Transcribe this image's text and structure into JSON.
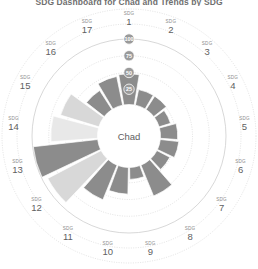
{
  "chart": {
    "title": "SDG Dashboard for Chad and Trends by SDG",
    "center_label": "Chad",
    "sdg_prefix": "SDG",
    "axis_ticks": [
      "100",
      "75",
      "50",
      "25"
    ],
    "tick_values": [
      100,
      75,
      50,
      25
    ]
  },
  "colors": {
    "dark_gray": "#8c8c8c",
    "light_gray": "#d8d8d8",
    "pale_gray": "#e8e8e8",
    "grid": "#c9c9c9",
    "hub_text": "#5e5e5e",
    "label_text": "#5f5f5f",
    "tick_bubble": "#9a9a9a",
    "background": "#ffffff"
  },
  "chart_data": {
    "type": "bar",
    "title": "SDG Dashboard for Chad and Trends by SDG",
    "subtitle": "Chad",
    "xlabel": "",
    "ylabel": "SDG Index score",
    "ylim": [
      0,
      100
    ],
    "grid": true,
    "legend": "none",
    "radial": true,
    "categories": [
      "SDG 1",
      "SDG 2",
      "SDG 3",
      "SDG 4",
      "SDG 5",
      "SDG 6",
      "SDG 7",
      "SDG 8",
      "SDG 9",
      "SDG 10",
      "SDG 11",
      "SDG 12",
      "SDG 13",
      "SDG 14",
      "SDG 15",
      "SDG 16",
      "SDG 17"
    ],
    "tick_labels": [
      "25",
      "50",
      "75",
      "100"
    ],
    "values": [
      48,
      26,
      26,
      20,
      28,
      30,
      24,
      52,
      20,
      42,
      58,
      92,
      99,
      72,
      62,
      36,
      46
    ],
    "shades": [
      "dark",
      "dark",
      "dark",
      "dark",
      "dark",
      "dark",
      "dark",
      "dark",
      "dark",
      "dark",
      "dark",
      "light",
      "dark",
      "pale",
      "light",
      "dark",
      "dark"
    ],
    "series": [
      {
        "name": "SDG Index score",
        "values": [
          48,
          26,
          26,
          20,
          28,
          30,
          24,
          52,
          20,
          42,
          58,
          92,
          99,
          72,
          62,
          36,
          46
        ]
      }
    ]
  },
  "labels": [
    {
      "prefix": "SDG",
      "num": "1"
    },
    {
      "prefix": "SDG",
      "num": "2"
    },
    {
      "prefix": "SDG",
      "num": "3"
    },
    {
      "prefix": "SDG",
      "num": "4"
    },
    {
      "prefix": "SDG",
      "num": "5"
    },
    {
      "prefix": "SDG",
      "num": "6"
    },
    {
      "prefix": "SDG",
      "num": "7"
    },
    {
      "prefix": "SDG",
      "num": "8"
    },
    {
      "prefix": "SDG",
      "num": "9"
    },
    {
      "prefix": "SDG",
      "num": "10"
    },
    {
      "prefix": "SDG",
      "num": "11"
    },
    {
      "prefix": "SDG",
      "num": "12"
    },
    {
      "prefix": "SDG",
      "num": "13"
    },
    {
      "prefix": "SDG",
      "num": "14"
    },
    {
      "prefix": "SDG",
      "num": "15"
    },
    {
      "prefix": "SDG",
      "num": "16"
    },
    {
      "prefix": "SDG",
      "num": "17"
    }
  ]
}
